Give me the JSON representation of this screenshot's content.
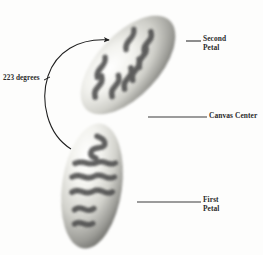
{
  "diagram": {
    "background_color": "#fdfdfc",
    "annotation_color": "#2b2b2b",
    "petal_light_color": "#f4f4f0",
    "petal_mid_color": "#b9b9b4",
    "petal_shadow_color": "#6f6f6c",
    "pattern_color": "#4a4a4a",
    "angle_annotation": {
      "text": "223 degrees",
      "value": 223,
      "unit": "degrees",
      "arrow": "curved-rotation-arrow-counterclockwise"
    },
    "callouts": [
      {
        "name": "second-petal",
        "line1": "Second",
        "line2": "Petal",
        "leader": "horizontal-line"
      },
      {
        "name": "canvas-center",
        "line1": "Canvas Center",
        "line2": "",
        "leader": "horizontal-line"
      },
      {
        "name": "first-petal",
        "line1": "First",
        "line2": "Petal",
        "leader": "horizontal-line"
      }
    ],
    "shapes": [
      {
        "name": "second-petal-shape",
        "type": "ellipse",
        "rotation_degrees": 43,
        "pattern": "zigzag-squiggle"
      },
      {
        "name": "first-petal-shape",
        "type": "ellipse",
        "rotation_degrees": 8,
        "pattern": "zigzag-squiggle"
      }
    ]
  }
}
